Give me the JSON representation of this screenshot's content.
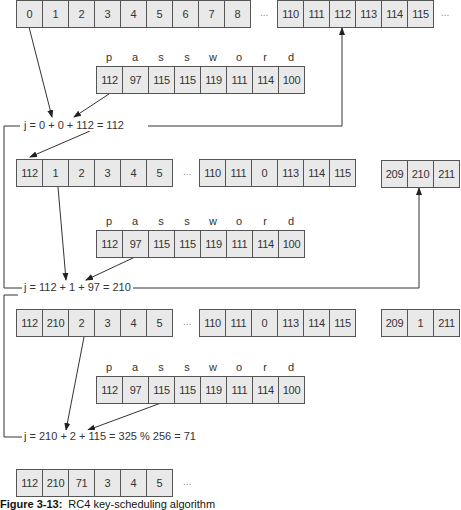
{
  "diagram": {
    "step1": {
      "s_left": [
        "0",
        "1",
        "2",
        "3",
        "4",
        "5",
        "6",
        "7",
        "8"
      ],
      "s_right": [
        "110",
        "111",
        "112",
        "113",
        "114",
        "115"
      ],
      "key_labels": [
        "p",
        "a",
        "s",
        "s",
        "w",
        "o",
        "r",
        "d"
      ],
      "key_values": [
        "112",
        "97",
        "115",
        "115",
        "119",
        "111",
        "114",
        "100"
      ],
      "formula": "j = 0 + 0 + 112 = 112"
    },
    "step2": {
      "s_left": [
        "112",
        "1",
        "2",
        "3",
        "4",
        "5"
      ],
      "s_right": [
        "110",
        "111",
        "0",
        "113",
        "114",
        "115"
      ],
      "s_far": [
        "209",
        "210",
        "211"
      ],
      "key_labels": [
        "p",
        "a",
        "s",
        "s",
        "w",
        "o",
        "r",
        "d"
      ],
      "key_values": [
        "112",
        "97",
        "115",
        "115",
        "119",
        "111",
        "114",
        "100"
      ],
      "formula": "j = 112 + 1 + 97 = 210"
    },
    "step3": {
      "s_left": [
        "112",
        "210",
        "2",
        "3",
        "4",
        "5"
      ],
      "s_right": [
        "110",
        "111",
        "0",
        "113",
        "114",
        "115"
      ],
      "s_far": [
        "209",
        "1",
        "211"
      ],
      "key_labels": [
        "p",
        "a",
        "s",
        "s",
        "w",
        "o",
        "r",
        "d"
      ],
      "key_values": [
        "112",
        "97",
        "115",
        "115",
        "119",
        "111",
        "114",
        "100"
      ],
      "formula": "j = 210 + 2 + 115 = 325 % 256 = 71"
    },
    "final": {
      "s_left": [
        "112",
        "210",
        "71",
        "3",
        "4",
        "5"
      ]
    },
    "ellipsis": "...",
    "caption_label": "Figure 3-13:",
    "caption_text": "RC4 key-scheduling algorithm"
  }
}
